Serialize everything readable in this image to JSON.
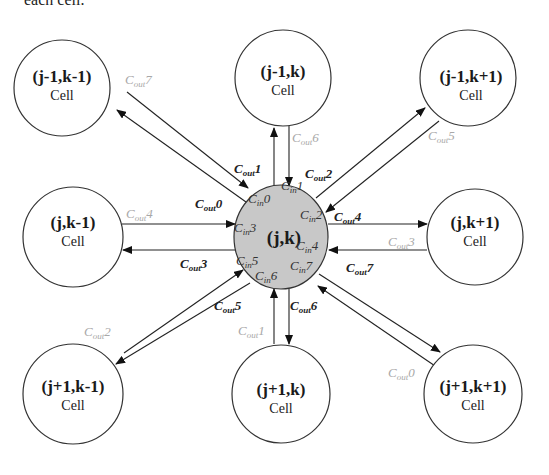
{
  "caption": "each cell.",
  "center": {
    "coord": "(j,k)",
    "fill": "#c8c8c8"
  },
  "cells": [
    {
      "coord": "(j-1,k-1)",
      "label": "Cell"
    },
    {
      "coord": "(j-1,k)",
      "label": "Cell"
    },
    {
      "coord": "(j-1,k+1)",
      "label": "Cell"
    },
    {
      "coord": "(j,k-1)",
      "label": "Cell"
    },
    {
      "coord": "(j,k+1)",
      "label": "Cell"
    },
    {
      "coord": "(j+1,k-1)",
      "label": "Cell"
    },
    {
      "coord": "(j+1,k)",
      "label": "Cell"
    },
    {
      "coord": "(j+1,k+1)",
      "label": "Cell"
    }
  ],
  "labels": {
    "C": "C",
    "out": "out",
    "in": "in",
    "center_outputs": [
      "1",
      "2",
      "4",
      "7",
      "6",
      "5",
      "3",
      "0"
    ],
    "neighbor_outputs": [
      "7",
      "6",
      "5",
      "4",
      "3",
      "2",
      "1",
      "0"
    ],
    "center_inputs": [
      "0",
      "1",
      "2",
      "3",
      "4",
      "5",
      "6",
      "7"
    ]
  }
}
